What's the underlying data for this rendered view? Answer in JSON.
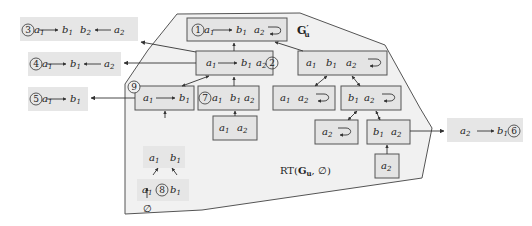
{
  "colors": {
    "region_fill": "#f1f1f1",
    "box_fill": "#e4e4e4",
    "box_stroke": "#555555",
    "outside_fill": "#e6e6e6",
    "line": "#333333"
  },
  "region": {
    "label": "RT(G'u, ∅)",
    "graph_label": "G'u"
  },
  "nodes": [
    {
      "id": "n1",
      "marker": "1",
      "content": "a1 → b1  a2 ↻"
    },
    {
      "id": "n2",
      "marker": "2",
      "content": "a1 → b1  a2"
    },
    {
      "id": "n_a1b1a2loop",
      "content": "a1  b1  a2 ↻"
    },
    {
      "id": "n9",
      "marker": "9",
      "content": "a1 → b1"
    },
    {
      "id": "n7",
      "marker": "7",
      "content": "a1  b1  a2"
    },
    {
      "id": "n_a1a2loop",
      "content": "a1  a2 ↻"
    },
    {
      "id": "n_b1a2loop",
      "content": "b1  a2 ↻"
    },
    {
      "id": "n_a1a2",
      "content": "a1  a2"
    },
    {
      "id": "n_a2loop",
      "content": "a2 ↻"
    },
    {
      "id": "n_b1a2",
      "content": "b1  a2"
    },
    {
      "id": "n_a2",
      "content": "a2"
    },
    {
      "id": "n_a1b1",
      "content": "a1  b1"
    },
    {
      "id": "n8",
      "marker": "8",
      "content": "a1  b1"
    },
    {
      "id": "n_empty",
      "content": "∅"
    }
  ],
  "outside": [
    {
      "marker": "3",
      "content": "a1 → b1  b2 ← a2"
    },
    {
      "marker": "4",
      "content": "a1 → b1 ← a2"
    },
    {
      "marker": "5",
      "content": "a1 → b1"
    },
    {
      "marker": "6",
      "content": "a2 → b1"
    }
  ],
  "labels": {
    "m1": "1",
    "m2": "2",
    "m3": "3",
    "m4": "4",
    "m5": "5",
    "m6": "6",
    "m7": "7",
    "m8": "8",
    "m9": "9",
    "a1": "a",
    "b1": "b",
    "a2": "a",
    "b2": "b",
    "sub1": "1",
    "sub2": "2",
    "empty": "∅",
    "rt_prefix": "RT(",
    "rt_G": "G",
    "rt_sub": "u",
    "rt_suffix": ", ∅)",
    "gu_G": "G",
    "gu_prime": "′",
    "gu_sub": "u"
  }
}
